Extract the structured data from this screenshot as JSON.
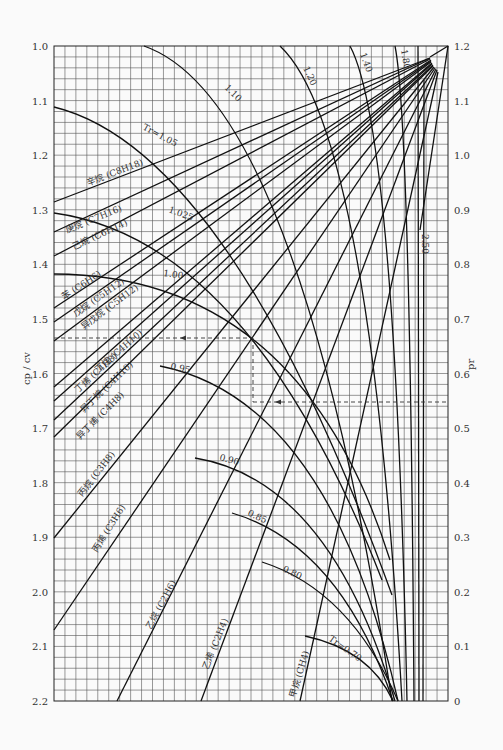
{
  "chart_data": {
    "type": "line",
    "title": "",
    "xlabel": "",
    "ylabel": "cp / cv",
    "ylabel_right": "pr",
    "ylim_left": [
      1.0,
      2.2
    ],
    "ylim_right": [
      0,
      1.2
    ],
    "left_ticks": [
      "1.0",
      "1.1",
      "1.2",
      "1.3",
      "1.4",
      "1.5",
      "1.6",
      "1.7",
      "1.8",
      "1.9",
      "2.0",
      "2.1",
      "2.2"
    ],
    "right_ticks": [
      "1.2",
      "1.1",
      "1.0",
      "0.9",
      "0.8",
      "0.7",
      "0.6",
      "0.5",
      "0.4",
      "0.3",
      "0.2",
      "0.1",
      "0"
    ],
    "grid": true,
    "gas_lines": [
      {
        "name": "辛烷 (C8H18)",
        "start_cp_cv": 1.285
      },
      {
        "name": "庚烷 (C7H16)",
        "start_cp_cv": 1.34
      },
      {
        "name": "己烷 (C6H14)",
        "start_cp_cv": 1.385
      },
      {
        "name": "苯 (C6H6)",
        "start_cp_cv": 1.48
      },
      {
        "name": "戊烷 (C5H12)",
        "start_cp_cv": 1.505
      },
      {
        "name": "异戊烷 (C5H12)",
        "start_cp_cv": 1.54
      },
      {
        "name": "丁烷 (C4H10)",
        "start_cp_cv": 1.625
      },
      {
        "name": "丁烯 (C4H8)",
        "start_cp_cv": 1.65
      },
      {
        "name": "异丁烷 (C4H10)",
        "start_cp_cv": 1.685
      },
      {
        "name": "异丁烯 (C4H8)",
        "start_cp_cv": 1.715
      },
      {
        "name": "丙烷 (C3H8)",
        "start_cp_cv": 1.9
      },
      {
        "name": "丙烯 (C3H6)",
        "start_cp_cv": 2.06
      },
      {
        "name": "乙烷 (C2H6)",
        "start_cp_cv": 2.2
      },
      {
        "name": "乙烯 (C2H4)",
        "start_cp_cv": 2.2
      },
      {
        "name": "甲烷 (CH4)",
        "start_cp_cv": 2.2
      }
    ],
    "tr_curves": [
      {
        "label": "Tr=0.70"
      },
      {
        "label": "0.80"
      },
      {
        "label": "0.85"
      },
      {
        "label": "0.90"
      },
      {
        "label": "0.95"
      },
      {
        "label": "1.00"
      },
      {
        "label": "1.025"
      },
      {
        "label": "Tr=1.05"
      },
      {
        "label": "1.10"
      },
      {
        "label": "1.20"
      },
      {
        "label": "1.40"
      },
      {
        "label": "1.80"
      },
      {
        "label": "2.50"
      }
    ],
    "example_reading": {
      "cp_cv": 1.535,
      "pr": 0.56
    }
  },
  "labels": {
    "y_left": "cp / cv",
    "y_right": "pr",
    "tr_070": "Tr=0.70",
    "tr_080": "0.80",
    "tr_085": "0.85",
    "tr_090": "0.90",
    "tr_095": "0.95",
    "tr_100": "1.00",
    "tr_1025": "1.025",
    "tr_105": "Tr=1.05",
    "tr_110": "1.10",
    "tr_120": "1.20",
    "tr_140": "1.40",
    "tr_180": "1.80",
    "tr_250": "2.50",
    "octane": "辛烷 (C8H18)",
    "heptane": "庚烷 (C7H16)",
    "hexane": "己烷 (C6H14)",
    "benzene": "苯 (C6H6)",
    "pentane": "戊烷 (C5H12)",
    "isopentane": "异戊烷 (C5H12)",
    "butane": "丁烷 (C4H10)",
    "butene": "丁烯 (C4H8)",
    "isobutane": "异丁烷 (C4H10)",
    "isobutene": "异丁烯 (C4H8)",
    "propane": "丙烷 (C3H8)",
    "propylene": "丙烯 (C3H6)",
    "ethane": "乙烷 (C2H6)",
    "ethylene": "乙烯 (C2H4)",
    "methane": "甲烷 (CH4)"
  }
}
